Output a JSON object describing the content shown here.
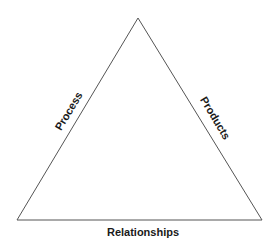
{
  "diagram": {
    "shape": "triangle",
    "line_color": "#555555",
    "edges": {
      "left": "Process",
      "right": "Products",
      "bottom": "Relationships"
    }
  }
}
